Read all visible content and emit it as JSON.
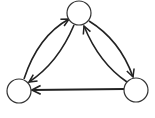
{
  "diagram": {
    "type": "directed-graph",
    "nodes": [
      {
        "id": "top",
        "cx": 79,
        "cy": 13,
        "r": 12,
        "label": ""
      },
      {
        "id": "left",
        "cx": 19,
        "cy": 91,
        "r": 12,
        "label": ""
      },
      {
        "id": "right",
        "cx": 136,
        "cy": 90,
        "r": 12,
        "label": ""
      }
    ],
    "edges": [
      {
        "from": "left",
        "to": "top",
        "style": "curved-outer"
      },
      {
        "from": "top",
        "to": "left",
        "style": "curved-inner"
      },
      {
        "from": "top",
        "to": "right",
        "style": "curved-outer"
      },
      {
        "from": "right",
        "to": "top",
        "style": "curved-inner"
      },
      {
        "from": "right",
        "to": "left",
        "style": "straight"
      }
    ],
    "colors": {
      "stroke": "#222222",
      "node_fill": "#ffffff"
    }
  }
}
